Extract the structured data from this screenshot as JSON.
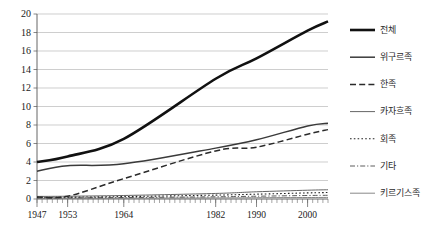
{
  "chart_data": {
    "type": "line",
    "title": "",
    "xlabel": "",
    "ylabel": "",
    "xlim": [
      1947,
      2004
    ],
    "ylim": [
      0,
      20
    ],
    "ytick_step": 2,
    "yticks": [
      0,
      2,
      4,
      6,
      8,
      10,
      12,
      14,
      16,
      18,
      20
    ],
    "xticks": [
      1947,
      1953,
      1964,
      1982,
      1990,
      2000
    ],
    "xtick_labels": [
      "1947",
      "1953",
      "1964",
      "1982",
      "1990",
      "2000"
    ],
    "grid": "horizontal",
    "legend_position": "right",
    "minor_ticks": "yearly",
    "series": [
      {
        "name": "전체",
        "style": "solid",
        "width": 2.6,
        "color": "#111111",
        "x": [
          1947,
          1953,
          1964,
          1982,
          1990,
          2000,
          2004
        ],
        "values": [
          4.0,
          4.6,
          6.5,
          13.0,
          15.2,
          18.2,
          19.2
        ]
      },
      {
        "name": "위구르족",
        "style": "solid",
        "width": 1.5,
        "color": "#3a3a3a",
        "x": [
          1947,
          1953,
          1964,
          1982,
          1990,
          2000,
          2004
        ],
        "values": [
          3.0,
          3.6,
          3.8,
          5.5,
          6.4,
          7.9,
          8.2
        ]
      },
      {
        "name": "한족",
        "style": "dashed",
        "width": 1.5,
        "color": "#2a2a2a",
        "x": [
          1947,
          1953,
          1964,
          1982,
          1990,
          2000,
          2004
        ],
        "values": [
          0.22,
          0.3,
          2.2,
          5.2,
          5.6,
          7.0,
          7.5
        ]
      },
      {
        "name": "카자흐족",
        "style": "solid",
        "width": 0.9,
        "color": "#555555",
        "x": [
          1947,
          1953,
          1964,
          1982,
          1990,
          2000,
          2004
        ],
        "values": [
          0.28,
          0.3,
          0.38,
          0.6,
          0.78,
          0.95,
          1.0
        ]
      },
      {
        "name": "회족",
        "style": "dotted",
        "width": 1.1,
        "color": "#222222",
        "x": [
          1947,
          1953,
          1964,
          1982,
          1990,
          2000,
          2004
        ],
        "values": [
          0.18,
          0.2,
          0.26,
          0.42,
          0.52,
          0.66,
          0.7
        ]
      },
      {
        "name": "기타",
        "style": "dashdot",
        "width": 0.9,
        "color": "#4a4a4a",
        "x": [
          1947,
          1953,
          1964,
          1982,
          1990,
          2000,
          2004
        ],
        "values": [
          0.12,
          0.13,
          0.16,
          0.24,
          0.3,
          0.38,
          0.4
        ]
      },
      {
        "name": "키르기스족",
        "style": "solid",
        "width": 0.8,
        "color": "#6a6a6a",
        "x": [
          1947,
          1953,
          1964,
          1982,
          1990,
          2000,
          2004
        ],
        "values": [
          0.07,
          0.08,
          0.09,
          0.12,
          0.14,
          0.16,
          0.17
        ]
      }
    ]
  },
  "legend": {
    "items": [
      {
        "label": "전체"
      },
      {
        "label": "위구르족"
      },
      {
        "label": "한족"
      },
      {
        "label": "카자흐족"
      },
      {
        "label": "회족"
      },
      {
        "label": "기타"
      },
      {
        "label": "키르기스족"
      }
    ]
  }
}
